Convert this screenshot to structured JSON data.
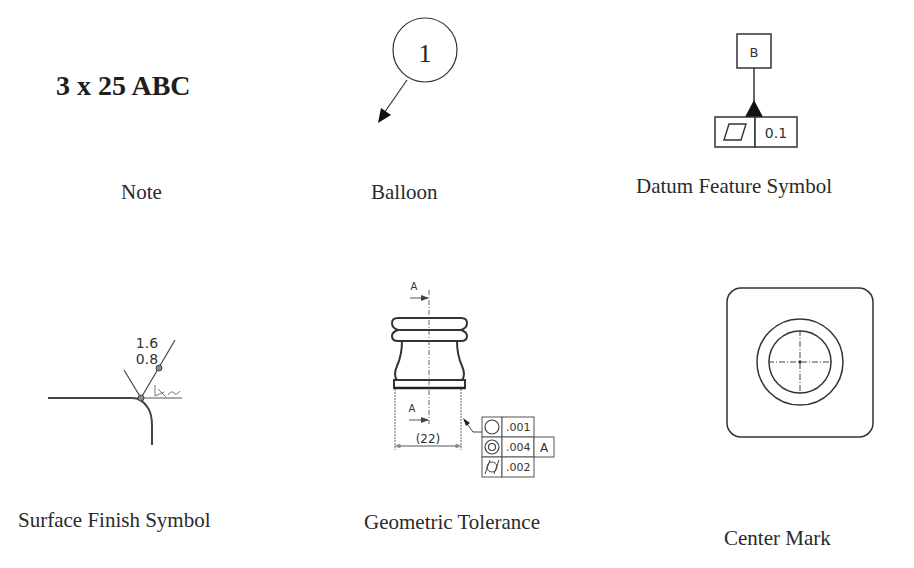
{
  "items": [
    {
      "id": "note",
      "caption": "Note",
      "content": {
        "text": "3 x 25 ABC"
      }
    },
    {
      "id": "balloon",
      "caption": "Balloon",
      "content": {
        "number": "1"
      }
    },
    {
      "id": "datum-feature-symbol",
      "caption": "Datum Feature Symbol",
      "content": {
        "datum_letter": "B",
        "tolerance_value": "0.1",
        "symbol": "flatness-parallelogram"
      }
    },
    {
      "id": "surface-finish-symbol",
      "caption": "Surface Finish Symbol",
      "content": {
        "value_top": "1.6",
        "value_bottom": "0.8"
      }
    },
    {
      "id": "geometric-tolerance",
      "caption": "Geometric Tolerance",
      "content": {
        "datum_label_top": "A",
        "datum_label_bottom": "A",
        "dimension": "(22)",
        "frame_rows": [
          {
            "symbol": "circularity",
            "value": ".001",
            "datum": ""
          },
          {
            "symbol": "concentricity",
            "value": ".004",
            "datum": "A"
          },
          {
            "symbol": "cylindricity",
            "value": ".002",
            "datum": ""
          }
        ]
      }
    },
    {
      "id": "center-mark",
      "caption": "Center Mark",
      "content": {}
    }
  ]
}
